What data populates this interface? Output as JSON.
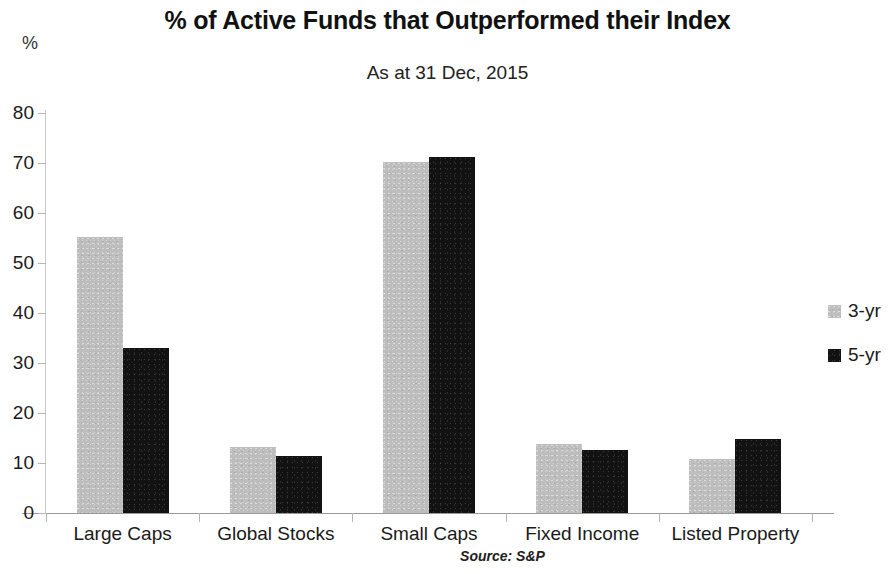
{
  "chart_data": {
    "type": "bar",
    "title": "% of Active Funds that Outperformed their Index",
    "subtitle": "As at 31 Dec, 2015",
    "unit_label": "%",
    "source": "Source: S&P",
    "xlabel": "",
    "ylabel": "%",
    "ylim": [
      0,
      80
    ],
    "ytick_step": 10,
    "yticks": [
      80,
      70,
      60,
      50,
      40,
      30,
      20,
      10,
      0
    ],
    "ytick_labels": [
      "80",
      "70",
      "60",
      "50",
      "40",
      "30",
      "20",
      "10",
      "0"
    ],
    "grid": false,
    "legend_position": "right",
    "categories": [
      "Large Caps",
      "Global Stocks",
      "Small Caps",
      "Fixed Income",
      "Listed Property"
    ],
    "series": [
      {
        "name": "3-yr",
        "color": "#bdbdbd",
        "values": [
          55.3,
          13.2,
          70.2,
          13.9,
          10.8
        ]
      },
      {
        "name": "5-yr",
        "color": "#121212",
        "values": [
          33.0,
          11.5,
          71.2,
          12.7,
          14.8
        ]
      }
    ]
  },
  "legend": {
    "items": [
      {
        "label": "3-yr",
        "color": "#bdbdbd"
      },
      {
        "label": "5-yr",
        "color": "#121212"
      }
    ]
  }
}
